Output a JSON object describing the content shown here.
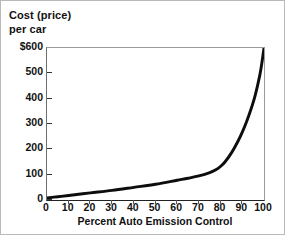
{
  "chart_data": {
    "type": "line",
    "title": "",
    "ylabel_lines": [
      "Cost (price)",
      "per car"
    ],
    "xlabel": "Percent Auto Emission Control",
    "xlim": [
      0,
      100
    ],
    "ylim": [
      0,
      600
    ],
    "grid": false,
    "legend": null,
    "x_ticks": [
      0,
      10,
      20,
      30,
      40,
      50,
      60,
      70,
      80,
      90,
      100
    ],
    "x_tick_labels": [
      "0",
      "10",
      "20",
      "30",
      "40",
      "50",
      "60",
      "70",
      "80",
      "90",
      "100"
    ],
    "y_ticks": [
      0,
      100,
      200,
      300,
      400,
      500,
      600
    ],
    "y_tick_labels": [
      "0",
      "100",
      "200",
      "300",
      "400",
      "500",
      "600"
    ],
    "y_tick_label_top": "$600",
    "series": [
      {
        "name": "Cost per car",
        "color": "#0d0d0d",
        "x": [
          0,
          5,
          10,
          20,
          30,
          40,
          50,
          60,
          65,
          70,
          75,
          78,
          80,
          82,
          85,
          88,
          90,
          92,
          94,
          96,
          98,
          99,
          100
        ],
        "values": [
          8,
          13,
          18,
          28,
          38,
          50,
          62,
          78,
          86,
          95,
          108,
          120,
          133,
          150,
          186,
          232,
          268,
          310,
          358,
          415,
          490,
          540,
          600
        ]
      }
    ]
  },
  "axes": {
    "y_axis_title_line1": "Cost (price)",
    "y_axis_title_line2": "per car",
    "x_axis_title": "Percent Auto Emission Control"
  },
  "colors": {
    "curve": "#0d0d0d",
    "frame": "#9a9a9a",
    "axis": "#222222",
    "text": "#111111",
    "background": "#ffffff",
    "outer_border": "#b9b9b9"
  }
}
